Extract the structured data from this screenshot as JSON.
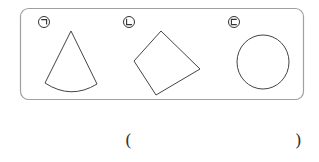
{
  "labels": {
    "shape_a": "㉠",
    "shape_b": "㉡",
    "shape_c": "㉢"
  },
  "shapes": [
    {
      "id": "㉠",
      "type": "sector",
      "description": "fan-shaped sector (circle sector)"
    },
    {
      "id": "㉡",
      "type": "quadrilateral",
      "description": "tilted four-sided polygon"
    },
    {
      "id": "㉢",
      "type": "circle",
      "description": "circle"
    }
  ],
  "answer": {
    "open_paren": "(",
    "close_paren": ")",
    "value": ""
  },
  "colors": {
    "stroke": "#444444",
    "box_border": "#9a9a9a",
    "background": "#ffffff"
  }
}
